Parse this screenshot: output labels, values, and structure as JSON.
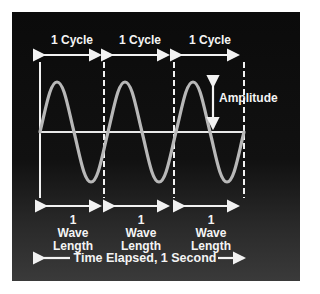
{
  "diagram": {
    "type": "sine-wave-explainer",
    "cycle_labels": [
      "1 Cycle",
      "1 Cycle",
      "1 Cycle"
    ],
    "amplitude_label": "Amplitude",
    "wavelength_labels": [
      {
        "num": "1",
        "line1": "Wave",
        "line2": "Length"
      },
      {
        "num": "1",
        "line1": "Wave",
        "line2": "Length"
      },
      {
        "num": "1",
        "line1": "Wave",
        "line2": "Length"
      }
    ],
    "time_label": "Time Elapsed, 1 Second",
    "cycles": 3,
    "colors": {
      "background": "#0d0d0d",
      "wave": "#b8b8b8",
      "lines": "#f2f2f2"
    }
  }
}
